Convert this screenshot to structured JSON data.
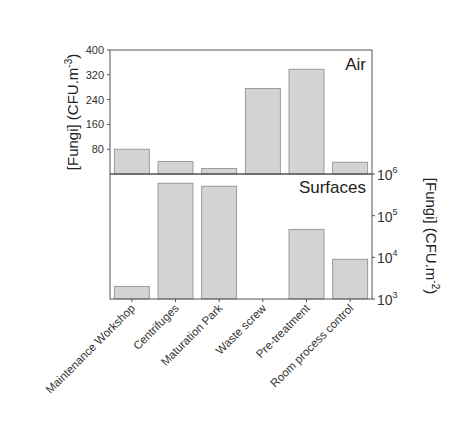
{
  "chart_data": [
    {
      "type": "bar",
      "panel_label": "Air",
      "categories": [
        "Maintenance Workshop",
        "Centrifuges",
        "Maturation Park",
        "Waste screw",
        "Pre-treatment",
        "Room process control"
      ],
      "values": [
        80,
        40,
        18,
        276,
        338,
        38
      ],
      "ylabel": "[Fungi] (CFU.m",
      "ylabel_sup": "-3",
      "ylabel_suffix": ")",
      "ylim": [
        0,
        400
      ],
      "yticks": [
        80,
        160,
        240,
        320,
        400
      ],
      "yscale": "linear",
      "axis_side": "left",
      "grid": false
    },
    {
      "type": "bar",
      "panel_label": "Surfaces",
      "categories": [
        "Maintenance Workshop",
        "Centrifuges",
        "Maturation Park",
        "Waste screw",
        "Pre-treatment",
        "Room process control"
      ],
      "values": [
        2000,
        600000,
        510000,
        0,
        47000,
        9000
      ],
      "ylabel": "[Fungi] (CFU.m",
      "ylabel_sup": "-2",
      "ylabel_suffix": ")",
      "ylim": [
        1000,
        1000000
      ],
      "yticks": [
        1000,
        10000,
        100000,
        1000000
      ],
      "ytick_labels": [
        {
          "base": "10",
          "exp": "3"
        },
        {
          "base": "10",
          "exp": "4"
        },
        {
          "base": "10",
          "exp": "5"
        },
        {
          "base": "10",
          "exp": "6"
        }
      ],
      "yscale": "log",
      "axis_side": "right",
      "grid": false
    }
  ],
  "colors": {
    "bar_fill": "#d3d3d3",
    "bar_stroke": "#8a8a8a",
    "axis": "#555555",
    "text": "#222222"
  }
}
